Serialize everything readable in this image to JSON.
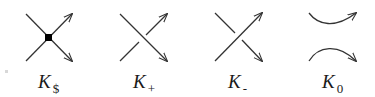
{
  "figure": {
    "panels": [
      {
        "id": "singular",
        "label_main": "K",
        "label_sub": "$",
        "type": "singular crossing with dot",
        "label_x": 38
      },
      {
        "id": "positive",
        "label_main": "K",
        "label_sub": "+",
        "type": "positive crossing",
        "label_x": 133
      },
      {
        "id": "negative",
        "label_main": "K",
        "label_sub": "-",
        "type": "negative crossing",
        "label_x": 228
      },
      {
        "id": "smoothing",
        "label_main": "K",
        "label_sub": "0",
        "type": "oriented smoothing",
        "label_x": 322
      }
    ],
    "colors": {
      "stroke": "#333333",
      "dot": "#000000",
      "background": "#ffffff"
    }
  }
}
